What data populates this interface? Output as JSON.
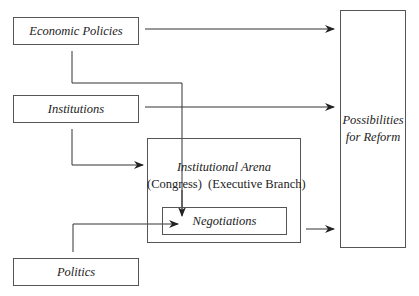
{
  "diagram": {
    "nodes": {
      "economic_policies": "Economic Policies",
      "institutions": "Institutions",
      "politics": "Politics",
      "institutional_arena": "Institutional Arena",
      "congress": "(Congress)",
      "executive_branch": "(Executive Branch)",
      "negotiations": "Negotiations",
      "possibilities_line1": "Possibilities",
      "possibilities_line2": "for Reform"
    },
    "edges": [
      {
        "from": "Economic Policies",
        "to": "Possibilities for Reform"
      },
      {
        "from": "Economic Policies",
        "to": "Negotiations"
      },
      {
        "from": "Institutions",
        "to": "Possibilities for Reform"
      },
      {
        "from": "Institutions",
        "to": "Institutional Arena"
      },
      {
        "from": "Politics",
        "to": "Negotiations"
      },
      {
        "from": "Institutional Arena",
        "to": "Possibilities for Reform"
      }
    ],
    "colors": {
      "line": "#333333",
      "box_border": "#555555",
      "text": "#222222",
      "background": "#ffffff"
    }
  }
}
